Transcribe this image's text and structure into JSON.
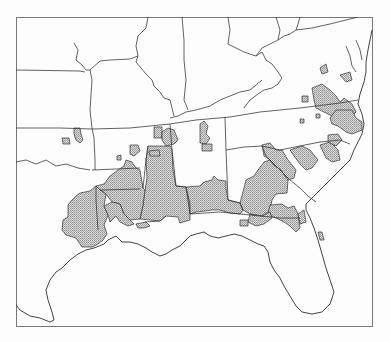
{
  "map": {
    "region": "Southeastern United States",
    "frame": {
      "x": 16,
      "y": 17,
      "width": 357,
      "height": 310
    },
    "colors": {
      "background": "#fdfdfd",
      "border": "#3a3a3a",
      "shaded_fill": "#c4c4c4",
      "frame": "#777777"
    },
    "legend": null,
    "labels": []
  }
}
